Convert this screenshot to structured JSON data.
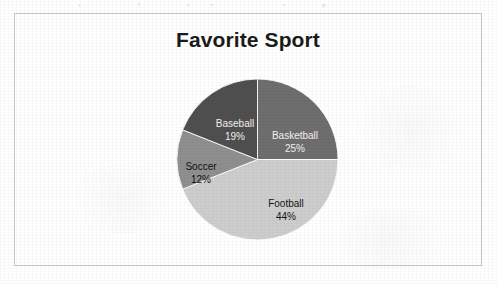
{
  "chart_data": {
    "type": "pie",
    "title": "Favorite Sport",
    "categories": [
      "Basketball",
      "Football",
      "Soccer",
      "Baseball"
    ],
    "values": [
      25,
      44,
      12,
      19
    ],
    "value_unit": "%",
    "labels": [
      "Basketball 25%",
      "Football 44%",
      "Soccer 12%",
      "Baseball 19%"
    ],
    "slices": [
      {
        "name": "Basketball",
        "value": 25,
        "display_value": "25%",
        "color": "#6e6e6e",
        "start_angle": 0,
        "end_angle": 90
      },
      {
        "name": "Football",
        "value": 44,
        "display_value": "44%",
        "color": "#cdcdcd",
        "start_angle": 90,
        "end_angle": 248.4
      },
      {
        "name": "Soccer",
        "value": 12,
        "display_value": "12%",
        "color": "#8f8f8f",
        "start_angle": 248.4,
        "end_angle": 291.6
      },
      {
        "name": "Baseball",
        "value": 19,
        "display_value": "19%",
        "color": "#4f4f4f",
        "start_angle": 291.6,
        "end_angle": 360
      }
    ],
    "total": 100,
    "legend": "none",
    "data_labels": "inside-slice",
    "start_angle_deg": 0,
    "direction": "clockwise",
    "grid": false,
    "xlabel": "",
    "ylabel": ""
  },
  "colors": {
    "title_text": "#1b1b1b",
    "label_text": "#151515",
    "frame_border": "#c8c8c8",
    "background": "#ffffff"
  }
}
